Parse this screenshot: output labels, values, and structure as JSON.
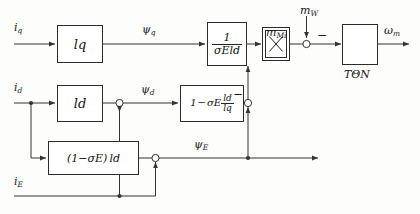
{
  "diagram": {
    "stroke_color": "#333333",
    "background_color": "#fdfdfc"
  },
  "signals": {
    "i_q": {
      "base": "i",
      "sub": "q"
    },
    "psi_q": {
      "base": "ψ",
      "sub": "q"
    },
    "m_Mi": {
      "base": "m",
      "sub": "Mi"
    },
    "m_W": {
      "base": "m",
      "sub": "W"
    },
    "omega_m": {
      "base": "ω",
      "sub": "m"
    },
    "i_d": {
      "base": "i",
      "sub": "d"
    },
    "psi_d": {
      "base": "ψ",
      "sub": "d"
    },
    "psi_E": {
      "base": "ψ",
      "sub": "E"
    },
    "i_E": {
      "base": "i",
      "sub": "E"
    }
  },
  "blocks": {
    "lq": {
      "name": "l_q",
      "base": "l",
      "sub": "q"
    },
    "ld": {
      "name": "l_d",
      "base": "l",
      "sub": "d"
    },
    "inv_sigma": {
      "name": "1 / (sigma_E l_d)",
      "numerator": "1",
      "denominator_sigma": "σ",
      "denominator_sigma_sub": "E",
      "denominator_l": "l",
      "denominator_l_sub": "d"
    },
    "one_minus_sigma_ratio": {
      "name": "1 - sigma_E l_d / l_q",
      "lead": "1",
      "minus": "−",
      "sigma": "σ",
      "sigma_sub": "E",
      "frac_num": "l",
      "frac_num_sub": "d",
      "frac_den": "l",
      "frac_den_sub": "q"
    },
    "one_minus_sigma_ld": {
      "name": "(1 - sigma_E) l_d",
      "open": "(1",
      "minus": "−",
      "sigma": "σ",
      "sigma_sub": "E",
      "close": ")",
      "l": "l",
      "l_sub": "d"
    },
    "multiplier": {
      "name": "multiplier",
      "glyph": "✕"
    },
    "integrator": {
      "name": "integrator T_Theta_N",
      "glyph": "ramp",
      "label_base": "T",
      "label_sub": "ΘN"
    }
  },
  "operators": {
    "minus_sign": "−",
    "sum_mW": {
      "name": "summing-junction-load-torque",
      "sign": "−"
    },
    "sum_psi_d": {
      "name": "summing-junction-psi-d"
    },
    "sum_psi_E_top": {
      "name": "summing-junction-psi-E-upper",
      "sign": "−"
    },
    "sum_psi_E_low": {
      "name": "summing-junction-psi-E-lower"
    }
  }
}
